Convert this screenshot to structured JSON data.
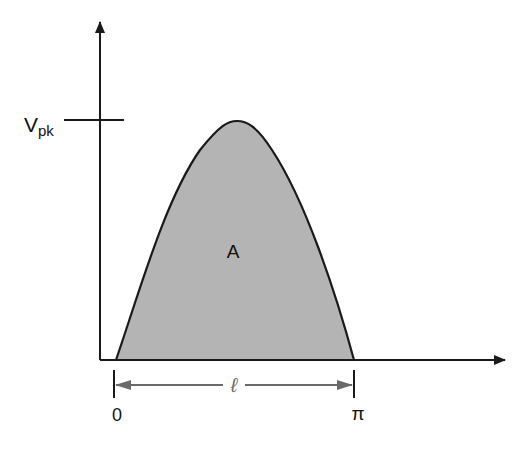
{
  "diagram": {
    "labels": {
      "vpk_main": "V",
      "vpk_sub": "pk",
      "area": "A",
      "length": "ℓ",
      "start": "0",
      "end": "π"
    },
    "colors": {
      "fill": "#b4b4b4",
      "stroke": "#1a1a1a",
      "dimension": "#6a6a6a",
      "background": "#ffffff"
    },
    "geometry": {
      "y_axis_x": 100,
      "x_axis_y": 360,
      "curve_start_x": 116,
      "curve_end_x": 354,
      "peak_y": 121
    }
  }
}
